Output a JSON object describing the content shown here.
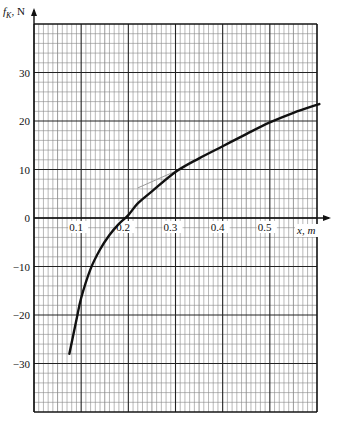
{
  "chart_data": {
    "type": "line",
    "title": "",
    "xlabel": "x, m",
    "ylabel": "f_K, N",
    "ylabel_main": "f",
    "ylabel_sub": "K",
    "ylabel_unit": ", N",
    "xlim": [
      0,
      0.6
    ],
    "ylim": [
      -40,
      40
    ],
    "grid": true,
    "x_ticks": [
      0.1,
      0.2,
      0.3,
      0.4,
      0.5
    ],
    "x_tick_labels": [
      "0.1",
      "0.2",
      "0.3",
      "0.4",
      "0.5"
    ],
    "y_ticks": [
      30,
      20,
      10,
      0,
      -10,
      -20,
      -30
    ],
    "y_tick_labels": [
      "30",
      "20",
      "10",
      "0",
      "−10",
      "−20",
      "−30"
    ],
    "series": [
      {
        "name": "f_K(x)",
        "color": "#111111",
        "x": [
          0.075,
          0.09,
          0.1,
          0.12,
          0.14,
          0.16,
          0.18,
          0.2,
          0.22,
          0.25,
          0.3,
          0.35,
          0.4,
          0.45,
          0.5,
          0.55,
          0.605
        ],
        "y": [
          -28,
          -21,
          -16.5,
          -10.5,
          -6.5,
          -3.5,
          -1.2,
          0.6,
          3,
          5.5,
          9.5,
          12.3,
          14.8,
          17.3,
          19.7,
          21.7,
          23.5
        ]
      }
    ],
    "annotations": [
      {
        "type": "tangent-line",
        "color": "#999999",
        "x": [
          0.22,
          0.32
        ],
        "y": [
          6.2,
          10.5
        ]
      }
    ]
  }
}
